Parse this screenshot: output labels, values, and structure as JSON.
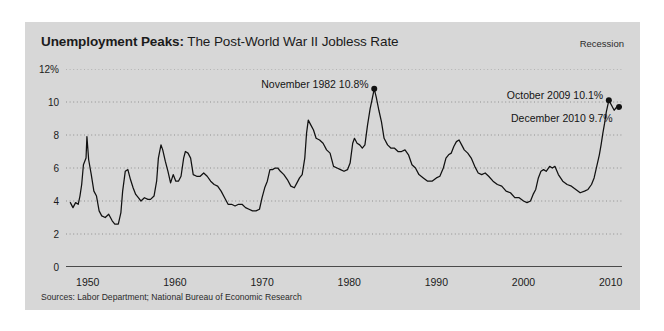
{
  "panel": {
    "background_color": "#d7d7d7",
    "page_background_color": "#ffffff"
  },
  "header": {
    "title_bold": "Unemployment Peaks:",
    "title_rest": " The Post-World War II Jobless Rate",
    "legend_label": "Recession"
  },
  "footer": {
    "source": "Sources: Labor Department; National Bureau of Economic Research"
  },
  "annotations": [
    {
      "text": "November 1982 10.8%",
      "x_year": 1982.87,
      "y_value": 10.8
    },
    {
      "text": "October 2009 10.1%",
      "x_year": 2009.79,
      "y_value": 10.1
    },
    {
      "text": "December 2010 9.7%",
      "x_year": 2010.96,
      "y_value": 9.7
    }
  ],
  "chart_data": {
    "type": "line",
    "title": "Unemployment Peaks: The Post-World War II Jobless Rate",
    "subtitle": "",
    "xlabel": "",
    "ylabel": "",
    "xlim": [
      1947.5,
      2011.3
    ],
    "ylim": [
      0,
      12
    ],
    "grid": true,
    "grid_style": "dotted",
    "legend_position": "top-right",
    "legend_entries": [
      "Recession"
    ],
    "ytick_labels": [
      "12%",
      "10",
      "8",
      "6",
      "4",
      "2",
      "0"
    ],
    "yticks": [
      12,
      10,
      8,
      6,
      4,
      2,
      0
    ],
    "xtick_labels": [
      "1950",
      "1960",
      "1970",
      "1980",
      "1990",
      "2000",
      "2010"
    ],
    "xticks": [
      1950,
      1960,
      1970,
      1980,
      1990,
      2000,
      2010
    ],
    "line_color": "#111111",
    "series": [
      {
        "name": "US Unemployment Rate",
        "x": [
          1948.0,
          1948.3,
          1948.6,
          1948.9,
          1949.1,
          1949.3,
          1949.5,
          1949.8,
          1949.9,
          1950.1,
          1950.4,
          1950.7,
          1951.0,
          1951.3,
          1951.6,
          1952.0,
          1952.4,
          1952.8,
          1953.1,
          1953.5,
          1953.8,
          1954.0,
          1954.3,
          1954.6,
          1954.9,
          1955.2,
          1955.5,
          1955.8,
          1956.1,
          1956.5,
          1956.9,
          1957.2,
          1957.6,
          1957.9,
          1958.1,
          1958.4,
          1958.6,
          1958.9,
          1959.2,
          1959.5,
          1959.8,
          1960.1,
          1960.4,
          1960.7,
          1961.0,
          1961.2,
          1961.5,
          1961.8,
          1962.1,
          1962.5,
          1962.9,
          1963.3,
          1963.7,
          1964.1,
          1964.5,
          1964.9,
          1965.3,
          1965.7,
          1966.1,
          1966.5,
          1966.9,
          1967.3,
          1967.7,
          1968.1,
          1968.5,
          1968.9,
          1969.3,
          1969.7,
          1970.0,
          1970.3,
          1970.6,
          1970.9,
          1971.2,
          1971.5,
          1971.8,
          1972.1,
          1972.5,
          1972.9,
          1973.3,
          1973.7,
          1974.0,
          1974.3,
          1974.6,
          1974.9,
          1975.1,
          1975.3,
          1975.6,
          1975.9,
          1976.2,
          1976.6,
          1977.0,
          1977.4,
          1977.8,
          1978.2,
          1978.6,
          1979.0,
          1979.4,
          1979.8,
          1980.1,
          1980.4,
          1980.6,
          1980.9,
          1981.2,
          1981.5,
          1981.8,
          1982.1,
          1982.4,
          1982.6,
          1982.87,
          1983.1,
          1983.4,
          1983.7,
          1984.0,
          1984.4,
          1984.8,
          1985.2,
          1985.6,
          1986.0,
          1986.4,
          1986.8,
          1987.2,
          1987.6,
          1988.0,
          1988.5,
          1989.0,
          1989.5,
          1990.0,
          1990.4,
          1990.8,
          1991.1,
          1991.4,
          1991.7,
          1992.0,
          1992.3,
          1992.6,
          1992.9,
          1993.2,
          1993.6,
          1994.0,
          1994.4,
          1994.8,
          1995.2,
          1995.6,
          1996.0,
          1996.5,
          1997.0,
          1997.5,
          1998.0,
          1998.5,
          1999.0,
          1999.5,
          2000.0,
          2000.4,
          2000.8,
          2001.1,
          2001.4,
          2001.7,
          2002.0,
          2002.3,
          2002.6,
          2003.0,
          2003.3,
          2003.6,
          2004.0,
          2004.5,
          2005.0,
          2005.5,
          2006.0,
          2006.5,
          2007.0,
          2007.4,
          2007.8,
          2008.1,
          2008.4,
          2008.7,
          2008.9,
          2009.1,
          2009.3,
          2009.5,
          2009.79,
          2010.1,
          2010.4,
          2010.7,
          2010.96
        ],
        "y": [
          3.9,
          3.6,
          3.9,
          3.8,
          4.3,
          5.0,
          6.2,
          6.6,
          7.9,
          6.5,
          5.6,
          4.6,
          4.3,
          3.4,
          3.1,
          3.0,
          3.2,
          2.8,
          2.6,
          2.6,
          3.3,
          4.6,
          5.8,
          5.9,
          5.3,
          4.8,
          4.4,
          4.2,
          4.0,
          4.2,
          4.1,
          4.1,
          4.3,
          5.2,
          6.6,
          7.4,
          7.1,
          6.4,
          5.8,
          5.1,
          5.6,
          5.2,
          5.2,
          5.5,
          6.6,
          7.0,
          6.9,
          6.6,
          5.6,
          5.5,
          5.5,
          5.7,
          5.5,
          5.2,
          5.0,
          4.9,
          4.6,
          4.2,
          3.8,
          3.8,
          3.7,
          3.8,
          3.8,
          3.6,
          3.5,
          3.4,
          3.4,
          3.5,
          4.2,
          4.8,
          5.2,
          5.9,
          5.9,
          6.0,
          6.0,
          5.8,
          5.6,
          5.3,
          4.9,
          4.8,
          5.1,
          5.4,
          5.6,
          6.6,
          8.1,
          8.9,
          8.6,
          8.3,
          7.8,
          7.7,
          7.5,
          7.1,
          6.9,
          6.1,
          6.0,
          5.9,
          5.8,
          5.9,
          6.3,
          7.5,
          7.8,
          7.5,
          7.4,
          7.2,
          7.4,
          8.6,
          9.6,
          10.1,
          10.8,
          10.3,
          9.5,
          8.8,
          7.8,
          7.4,
          7.2,
          7.2,
          7.0,
          7.0,
          7.1,
          6.8,
          6.2,
          6.0,
          5.6,
          5.4,
          5.2,
          5.2,
          5.4,
          5.5,
          6.0,
          6.6,
          6.8,
          6.9,
          7.3,
          7.6,
          7.7,
          7.4,
          7.1,
          6.9,
          6.6,
          6.1,
          5.7,
          5.6,
          5.7,
          5.5,
          5.2,
          5.0,
          4.9,
          4.6,
          4.5,
          4.2,
          4.2,
          4.0,
          3.9,
          4.0,
          4.4,
          4.7,
          5.4,
          5.8,
          5.9,
          5.8,
          6.1,
          6.0,
          6.1,
          5.6,
          5.2,
          5.0,
          4.9,
          4.7,
          4.5,
          4.6,
          4.7,
          5.0,
          5.4,
          6.1,
          6.8,
          7.4,
          8.1,
          8.7,
          9.4,
          10.1,
          9.8,
          9.5,
          9.7,
          9.7
        ]
      }
    ],
    "markers": [
      {
        "x_year": 1982.87,
        "y_value": 10.8
      },
      {
        "x_year": 2009.79,
        "y_value": 10.1
      },
      {
        "x_year": 2010.96,
        "y_value": 9.7
      }
    ]
  }
}
